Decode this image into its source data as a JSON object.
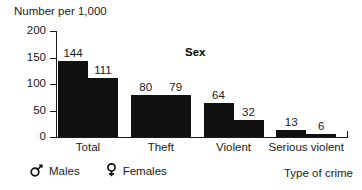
{
  "chart_data": {
    "type": "bar",
    "title": "",
    "ylabel": "Number per 1,000",
    "xlabel": "Type of crime",
    "legend_title": "Sex",
    "legend_position": "bottom-left",
    "grid": false,
    "ylim": [
      0,
      200
    ],
    "yticks": [
      0,
      50,
      100,
      150,
      200
    ],
    "ytick_labels": [
      "0",
      "50",
      "100",
      "150",
      "200"
    ],
    "categories": [
      "Total",
      "Theft",
      "Violent",
      "Serious violent"
    ],
    "series": [
      {
        "name": "Males",
        "symbol": "mars-symbol",
        "color": "#111111",
        "values": [
          144,
          80,
          64,
          13
        ],
        "value_labels": [
          "144",
          "80",
          "64",
          "13"
        ]
      },
      {
        "name": "Females",
        "symbol": "venus-symbol",
        "color": "#111111",
        "values": [
          111,
          79,
          32,
          6
        ],
        "value_labels": [
          "111",
          "79",
          "32",
          "6"
        ]
      }
    ]
  },
  "axes": {
    "y_title": "Number per 1,000",
    "x_title": "Type of crime",
    "y_ticks": [
      "200",
      "150",
      "100",
      "50",
      "0"
    ]
  },
  "legend": {
    "title": "Sex",
    "entries": [
      {
        "symbol_name": "mars-symbol",
        "label": "Males"
      },
      {
        "symbol_name": "venus-symbol",
        "label": "Females"
      }
    ]
  },
  "colors": {
    "bar": "#111111",
    "axis": "#1a1a1a",
    "text": "#1a1a1a",
    "background": "#ffffff"
  }
}
